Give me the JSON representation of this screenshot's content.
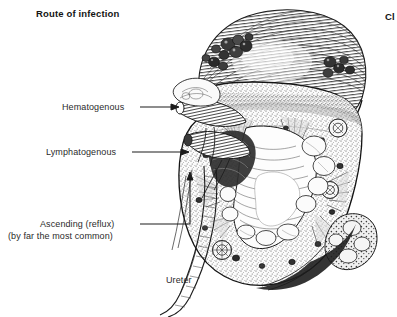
{
  "figure": {
    "title": "Route of infection",
    "chapter_marker": "Cl",
    "labels": {
      "hematogenous": "Hematogenous",
      "lymphatogenous": "Lymphatogenous",
      "ascending_line1": "Ascending (reflux)",
      "ascending_line2": "(by far the most common)",
      "ureter": "Ureter"
    },
    "colors": {
      "background": "#ffffff",
      "ink": "#1c1c1c",
      "label_text": "#2b2b2b",
      "title_text": "#141414",
      "stipple": "#555555",
      "pelvis_fill": "#fdfdfd",
      "cortex_fill": "#f2f2f2",
      "abscess_dark": "#2a2a2a"
    },
    "leaders": [
      {
        "name": "hematogenous-leader",
        "from_x": 140,
        "from_y": 107,
        "to_x": 178,
        "to_y": 107,
        "arrow": "right"
      },
      {
        "name": "lymphatogenous-leader",
        "from_x": 132,
        "from_y": 152,
        "to_x": 188,
        "to_y": 152,
        "arrow": "right"
      },
      {
        "name": "ascending-leader",
        "from_x": 140,
        "from_y": 224,
        "to_x": 190,
        "to_y": 224,
        "elbow_up_to_y": 172,
        "arrow": "up"
      }
    ]
  }
}
